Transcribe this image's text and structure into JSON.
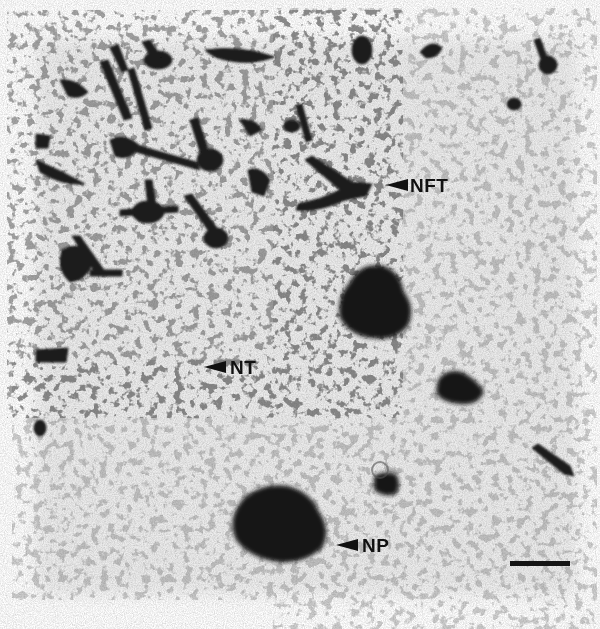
{
  "figure": {
    "type": "micrograph",
    "stain": "grayscale silver-stained tissue",
    "width": 600,
    "height": 629,
    "background_color": "#ffffff",
    "tissue_color": "#efefef",
    "stain_color": "#111111"
  },
  "annotations": [
    {
      "id": "nft",
      "text": "NFT",
      "label_x": 410,
      "label_y": 182,
      "arrow_x": 386,
      "arrow_y": 185
    },
    {
      "id": "nt",
      "text": "NT",
      "label_x": 230,
      "label_y": 364,
      "arrow_x": 204,
      "arrow_y": 366
    },
    {
      "id": "np",
      "text": "NP",
      "label_x": 362,
      "label_y": 541,
      "arrow_x": 336,
      "arrow_y": 545
    }
  ],
  "scale_bar": {
    "x": 510,
    "y": 561,
    "width": 60,
    "height": 5,
    "label": ""
  },
  "structures": {
    "plaques": [
      {
        "cx": 378,
        "cy": 303,
        "rx": 36,
        "ry": 36
      },
      {
        "cx": 280,
        "cy": 525,
        "rx": 48,
        "ry": 40
      },
      {
        "cx": 458,
        "cy": 390,
        "rx": 24,
        "ry": 17
      },
      {
        "cx": 388,
        "cy": 484,
        "rx": 15,
        "ry": 12
      }
    ]
  }
}
